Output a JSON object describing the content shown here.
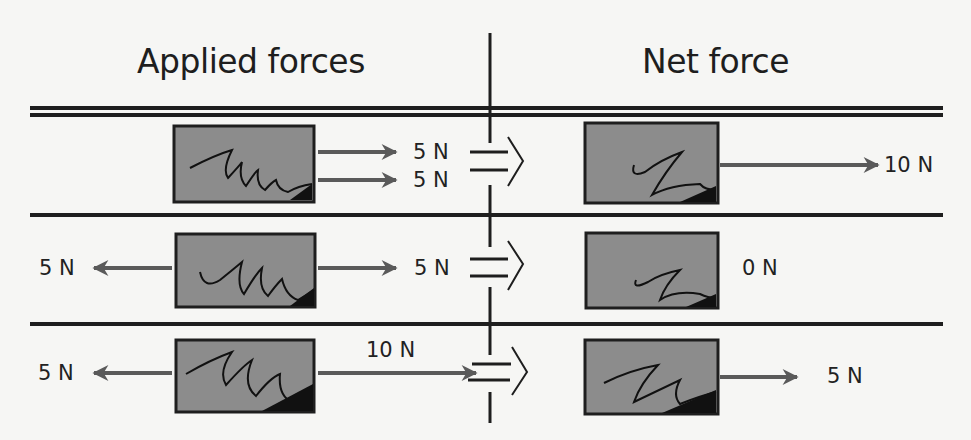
{
  "headings": {
    "left": "Applied forces",
    "right": "Net force"
  },
  "colors": {
    "background": "#f6f6f4",
    "line": "#1e1e1e",
    "box_fill": "#8c8c8c",
    "arrow": "#5a5a5a"
  },
  "rows": [
    {
      "applied": [
        {
          "direction": "right",
          "label": "5 N"
        },
        {
          "direction": "right",
          "label": "5 N"
        }
      ],
      "net": {
        "direction": "right",
        "label": "10 N"
      }
    },
    {
      "applied": [
        {
          "direction": "left",
          "label": "5 N"
        },
        {
          "direction": "right",
          "label": "5 N"
        }
      ],
      "net": {
        "direction": "none",
        "label": "0 N"
      }
    },
    {
      "applied": [
        {
          "direction": "left",
          "label": "5 N"
        },
        {
          "direction": "right",
          "label": "10 N"
        }
      ],
      "net": {
        "direction": "right",
        "label": "5 N"
      }
    }
  ],
  "equals_symbol": "=⟩"
}
